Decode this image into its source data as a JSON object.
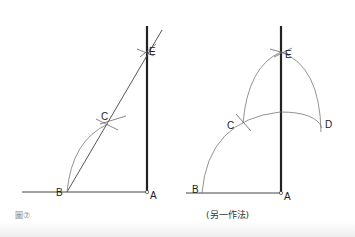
{
  "figure": {
    "label": "圖⑦",
    "left_diagram": {
      "points": {
        "A": "A",
        "B": "B",
        "C": "C",
        "E": "E"
      }
    },
    "right_diagram": {
      "caption": "(另一作法)",
      "points": {
        "A": "A",
        "B": "B",
        "C": "C",
        "D": "D",
        "E": "E"
      }
    }
  },
  "colors": {
    "line": "#333333",
    "thick_line": "#222222",
    "arc": "#777777"
  }
}
